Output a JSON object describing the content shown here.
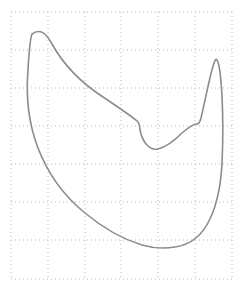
{
  "figure": {
    "title": "",
    "background_color": "#ffffff",
    "width": 245,
    "height": 295
  },
  "grid": {
    "visible": true,
    "style": "dotted",
    "color": "#b9b9bd",
    "line_width": 1,
    "dash_pattern": "1 3",
    "x_start": 11,
    "x_end": 232,
    "y_start": 12,
    "y_end": 279,
    "x_lines": [
      11,
      48,
      85,
      121,
      158,
      195,
      232
    ],
    "y_lines": [
      12,
      50,
      88,
      126,
      164,
      202,
      240,
      279
    ],
    "columns": 6,
    "rows": 7,
    "x_spacing": 36.8,
    "y_spacing": 38.1
  },
  "axes": {
    "x_tick_labels": [],
    "y_tick_labels": [],
    "xlabel": "",
    "ylabel": "",
    "frame_visible": false
  },
  "chart_data": {
    "type": "line",
    "title": "",
    "subtitle": "",
    "xlabel": "",
    "ylabel": "",
    "legend": [],
    "legend_position": "none",
    "grid": true,
    "xlim": [
      11,
      232
    ],
    "ylim": [
      12,
      279
    ],
    "series": [
      {
        "name": "closed-curve",
        "closed": true,
        "fill": "none",
        "stroke_color": "#8c8c8c",
        "stroke_width": 1.6,
        "annotations": [
          {
            "label": "left-peak-tip",
            "x": 32,
            "y": 34
          },
          {
            "label": "upper-shoulder-left",
            "x": 140,
            "y": 124
          },
          {
            "label": "central-dip-bottom",
            "x": 157,
            "y": 149
          },
          {
            "label": "upper-shoulder-right",
            "x": 197,
            "y": 124
          },
          {
            "label": "right-peak-tip",
            "x": 216,
            "y": 59
          },
          {
            "label": "right-outer-widest",
            "x": 222,
            "y": 166
          },
          {
            "label": "bottom-vertex",
            "x": 155,
            "y": 247
          },
          {
            "label": "left-outer-waist",
            "x": 30,
            "y": 104
          }
        ],
        "path": "M32,34 C40,28 46,33 52,44 C62,62 80,82 103,97 C118,107 130,115 137,121 C140,124 140,127 140,130 C141,135 143,141 147,145 C151,149 154,150 158,149 C166,147 174,141 182,133 C189,127 194,124 197,124 C199,124 200,122 201,118 C205,101 209,80 213,66 C215,60 216,58 217,60 C219,63 221,78 222,96 C223,116 223,142 222,163 C221,184 217,204 210,219 C202,236 190,245 175,247 C163,249 152,248 142,245 C122,239 103,228 85,213 C64,196 48,174 38,148 C28,122 26,94 28,70 C29,52 30,39 32,34 Z"
      }
    ]
  }
}
